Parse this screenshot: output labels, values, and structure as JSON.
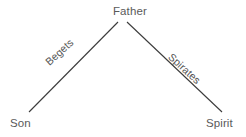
{
  "diagram": {
    "background_color": "#ffffff",
    "line_color": "#3b3b3b",
    "node_text_color": "#5a5a5a",
    "edge_text_color": "#545454",
    "nodes": [
      {
        "id": "father",
        "label": "Father"
      },
      {
        "id": "son",
        "label": "Son"
      },
      {
        "id": "spirit",
        "label": "Spirit"
      }
    ],
    "edges": [
      {
        "id": "begets",
        "label": "Begets",
        "from": "father",
        "to": "son"
      },
      {
        "id": "spirates",
        "label": "Spirates",
        "from": "father",
        "to": "spirit"
      }
    ]
  }
}
